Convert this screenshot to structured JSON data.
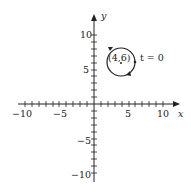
{
  "diagram": {
    "axes": {
      "x_label": "x",
      "y_label": "y",
      "x_ticks": [
        "−10",
        "−5",
        "5",
        "10"
      ],
      "y_ticks": [
        "10",
        "5",
        "−5",
        "−10"
      ],
      "range": [
        -10,
        10
      ]
    },
    "circle": {
      "center_label": "(4,6)",
      "center": [
        4,
        6
      ],
      "radius": 2,
      "direction": "clockwise"
    },
    "start_point": {
      "label": "t = 0",
      "coords": [
        6,
        6
      ]
    },
    "colors": {
      "stroke": "#222222",
      "background": "#ffffff"
    }
  }
}
